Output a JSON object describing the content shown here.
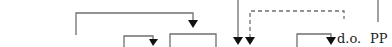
{
  "diagram": {
    "labels": {
      "direct_object": "d.o.",
      "prepositional_phrase": "PP"
    },
    "colors": {
      "line": "#6f6f6f",
      "arrow": "#111111",
      "text": "#222222",
      "background": "#ffffff"
    },
    "connectors": [
      {
        "id": "bracket-large",
        "style": "solid",
        "arrow": "down"
      },
      {
        "id": "bracket-small-1",
        "style": "solid",
        "arrow": "down"
      },
      {
        "id": "bracket-small-2",
        "style": "solid",
        "arrow": "none"
      },
      {
        "id": "vertical-from-top",
        "style": "solid",
        "arrow": "down"
      },
      {
        "id": "dashed-link",
        "style": "dashed",
        "arrow": "down"
      },
      {
        "id": "bracket-do",
        "style": "solid",
        "arrow": "down"
      },
      {
        "id": "pp-stem",
        "style": "solid",
        "arrow": "none"
      }
    ]
  }
}
